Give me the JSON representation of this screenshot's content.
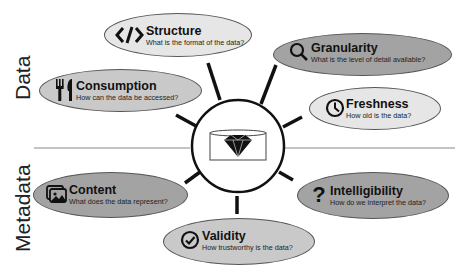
{
  "sections": {
    "data_label": "Data",
    "metadata_label": "Metadata"
  },
  "center": {
    "icon": "diamond-in-cylinder-icon"
  },
  "colors": {
    "light_fill": "#e6e6e6",
    "mid_fill": "#c9c9c9",
    "dark_fill": "#a3a3a3",
    "stroke": "#111111",
    "divider": "#888888"
  },
  "nodes": [
    {
      "id": "structure",
      "title": "Structure",
      "subtitle": "What is the format of the data?",
      "icon": "code-tag-icon",
      "section": "Data"
    },
    {
      "id": "granularity",
      "title": "Granularity",
      "subtitle": "What is the level of detail available?",
      "icon": "magnifier-icon",
      "section": "Data"
    },
    {
      "id": "consumption",
      "title": "Consumption",
      "subtitle": "How can the data be accessed?",
      "icon": "fork-knife-icon",
      "section": "Data"
    },
    {
      "id": "freshness",
      "title": "Freshness",
      "subtitle": "How old is the data?",
      "icon": "clock-icon",
      "section": "Data"
    },
    {
      "id": "content",
      "title": "Content",
      "subtitle": "What does the data represent?",
      "icon": "image-gallery-icon",
      "section": "Metadata"
    },
    {
      "id": "intelligibility",
      "title": "Intelligibility",
      "subtitle": "How do we interpret the data?",
      "icon": "question-mark-icon",
      "section": "Metadata"
    },
    {
      "id": "validity",
      "title": "Validity",
      "subtitle": "How trustworthy is the data?",
      "icon": "check-circle-icon",
      "section": "Metadata"
    }
  ]
}
